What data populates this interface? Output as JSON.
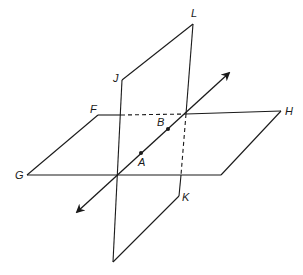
{
  "diagram": {
    "stroke_color": "#1a1a1a",
    "background": "#ffffff",
    "horizontal_plane": {
      "name": "plane FGH",
      "vertices": {
        "F": [
          98,
          115
        ],
        "H": [
          281,
          111
        ],
        "BR": [
          221,
          175
        ],
        "G": [
          27,
          175
        ]
      }
    },
    "vertical_plane": {
      "name": "plane JKL",
      "vertices": {
        "J": [
          122,
          80
        ],
        "L": [
          193,
          24
        ],
        "K": [
          179,
          196
        ],
        "BL": [
          113,
          262
        ]
      }
    },
    "hidden_edges": [
      {
        "from": [
          121,
          115
        ],
        "to": [
          186,
          114
        ]
      },
      {
        "from": [
          186,
          114
        ],
        "to": [
          181,
          175
        ]
      }
    ],
    "line_AB": {
      "from": [
        77,
        212
      ],
      "to": [
        229,
        73
      ]
    },
    "points": [
      {
        "label": "A",
        "pos": [
          141,
          153
        ],
        "label_pos": [
          138,
          166
        ]
      },
      {
        "label": "B",
        "pos": [
          168,
          129
        ],
        "label_pos": [
          157,
          126
        ]
      }
    ],
    "vertex_labels": [
      {
        "label": "L",
        "pos": [
          191,
          17
        ]
      },
      {
        "label": "J",
        "pos": [
          113,
          82
        ]
      },
      {
        "label": "F",
        "pos": [
          90,
          113
        ]
      },
      {
        "label": "H",
        "pos": [
          285,
          115
        ]
      },
      {
        "label": "G",
        "pos": [
          15,
          179
        ]
      },
      {
        "label": "K",
        "pos": [
          182,
          201
        ]
      }
    ]
  }
}
